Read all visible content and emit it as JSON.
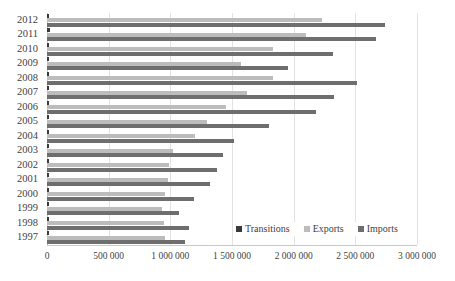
{
  "chart_data": {
    "type": "bar",
    "orientation": "horizontal",
    "title": "",
    "subtitle": "",
    "xlabel": "",
    "ylabel": "",
    "grid": true,
    "legend_position": "inside-bottom-right",
    "xlim": [
      0,
      3000000
    ],
    "xticks": [
      0,
      500000,
      1000000,
      1500000,
      2000000,
      2500000,
      3000000
    ],
    "xticklabels": [
      "0",
      "500 000",
      "1 000 000",
      "1 500 000",
      "2 000 000",
      "2 500 000",
      "3 000 000"
    ],
    "categories": [
      "2012",
      "2011",
      "2010",
      "2009",
      "2008",
      "2007",
      "2006",
      "2005",
      "2004",
      "2003",
      "2002",
      "2001",
      "2000",
      "1999",
      "1998",
      "1997"
    ],
    "series": [
      {
        "name": "Transitions",
        "color": "#3a3a3a",
        "values": [
          15000,
          25000,
          20000,
          15000,
          20000,
          20000,
          20000,
          15000,
          15000,
          12000,
          12000,
          10000,
          10000,
          10000,
          10000,
          8000
        ]
      },
      {
        "name": "Exports",
        "color": "#bcbcbc",
        "values": [
          2230000,
          2100000,
          1830000,
          1570000,
          1830000,
          1620000,
          1450000,
          1300000,
          1200000,
          1020000,
          990000,
          980000,
          960000,
          930000,
          950000,
          960000
        ]
      },
      {
        "name": "Imports",
        "color": "#6e6e6e",
        "values": [
          2740000,
          2670000,
          2320000,
          1950000,
          2510000,
          2330000,
          2180000,
          1800000,
          1520000,
          1430000,
          1380000,
          1320000,
          1190000,
          1070000,
          1150000,
          1120000
        ]
      }
    ]
  }
}
